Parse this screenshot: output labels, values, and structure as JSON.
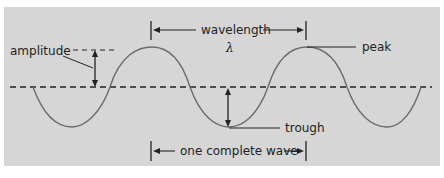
{
  "diagram": {
    "labels": {
      "wavelength": "wavelength",
      "lambda": "λ",
      "amplitude": "amplitude",
      "peak": "peak",
      "trough": "trough",
      "one_complete_wave": "one complete wave"
    },
    "colors": {
      "background": "#d6d6d6",
      "wave": "#6b6b6b",
      "lines": "#222222"
    }
  }
}
